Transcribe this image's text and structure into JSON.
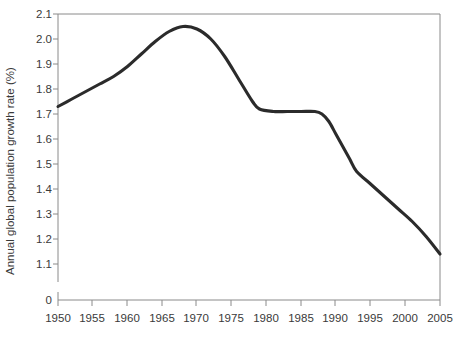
{
  "chart_data": {
    "type": "line",
    "title": "",
    "xlabel": "",
    "ylabel": "Annual global population growth rate (%)",
    "xlim": [
      1950,
      2005
    ],
    "ylim": [
      1.05,
      2.1
    ],
    "yaxis_break": true,
    "yaxis_break_label": "0",
    "grid": false,
    "legend": null,
    "line_color": "#2b2b2b",
    "xticks": [
      1950,
      1955,
      1960,
      1965,
      1970,
      1975,
      1980,
      1985,
      1990,
      1995,
      2000,
      2005
    ],
    "xtick_labels": [
      "1950",
      "1955",
      "1960",
      "1965",
      "1970",
      "1975",
      "1980",
      "1985",
      "1990",
      "1995",
      "2000",
      "2005"
    ],
    "yticks": [
      2.1,
      2.0,
      1.9,
      1.8,
      1.7,
      1.6,
      1.5,
      1.4,
      1.3,
      1.2,
      1.1
    ],
    "ytick_labels": [
      "2.1",
      "2.0",
      "1.9",
      "1.8",
      "1.7",
      "1.6",
      "1.5",
      "1.4",
      "1.3",
      "1.2",
      "1.1"
    ],
    "series": [
      {
        "name": "Annual global population growth rate",
        "x": [
          1950,
          1952,
          1954,
          1956,
          1958,
          1960,
          1962,
          1964,
          1966,
          1968,
          1970,
          1972,
          1974,
          1976,
          1978,
          1979,
          1981,
          1983,
          1985,
          1987,
          1988,
          1989,
          1990,
          1991,
          1992,
          1993,
          1995,
          1997,
          1999,
          2001,
          2003,
          2005
        ],
        "y": [
          1.73,
          1.76,
          1.79,
          1.82,
          1.85,
          1.89,
          1.94,
          1.99,
          2.03,
          2.05,
          2.04,
          2.0,
          1.93,
          1.84,
          1.75,
          1.72,
          1.71,
          1.71,
          1.71,
          1.71,
          1.7,
          1.67,
          1.62,
          1.57,
          1.52,
          1.47,
          1.42,
          1.37,
          1.32,
          1.27,
          1.21,
          1.14
        ]
      }
    ],
    "annotations": []
  },
  "figure": {
    "background_color": "#ffffff",
    "axis_color": "#8a8a8a",
    "text_color": "#3a3a3a"
  }
}
